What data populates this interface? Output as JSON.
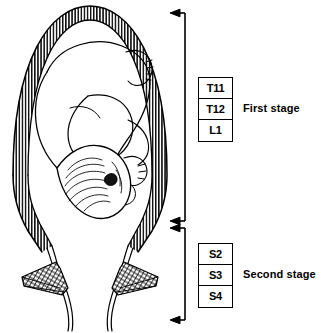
{
  "figure": {
    "illustration": {
      "name": "uterus-fetus-cross-section",
      "description": "Sagittal line drawing of a gravid uterus with hatched myometrial wall, fetus in cephalic presentation, cervix and cross-hatched pelvic floor muscles"
    }
  },
  "brackets": {
    "first_stage": {
      "name": "first-stage-bracket",
      "arrow_top": "arrow-left",
      "arrow_bottom": "arrow-left"
    },
    "second_stage": {
      "name": "second-stage-bracket",
      "arrow_top": "arrow-left",
      "arrow_bottom": "arrow-left"
    }
  },
  "first_stage": {
    "caption": "First stage",
    "segments": [
      {
        "label": "T11"
      },
      {
        "label": "T12"
      },
      {
        "label": "L1"
      }
    ]
  },
  "second_stage": {
    "caption": "Second stage",
    "segments": [
      {
        "label": "S2"
      },
      {
        "label": "S3"
      },
      {
        "label": "S4"
      }
    ]
  },
  "colors": {
    "ink": "#000000",
    "background": "#ffffff"
  }
}
